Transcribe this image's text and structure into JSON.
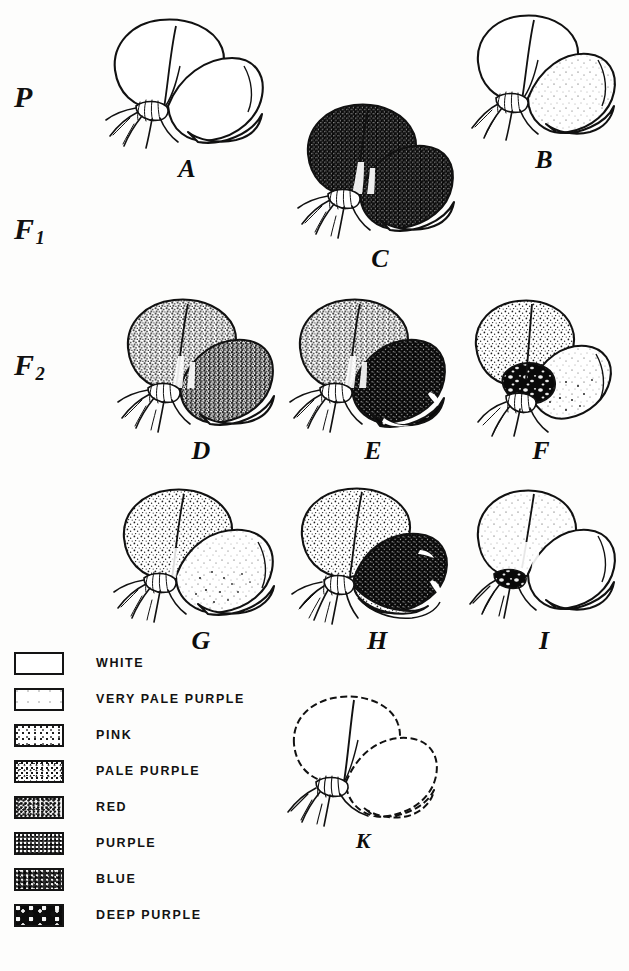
{
  "plate": {
    "title": "Inheritance of flower colour in the sweet pea",
    "background_color": "#fdfdfc",
    "ink_color": "#111111"
  },
  "generations": [
    {
      "id": "P",
      "label": "P",
      "subscript": "",
      "row_top": 80
    },
    {
      "id": "F1",
      "label": "F",
      "subscript": "1",
      "row_top": 212
    },
    {
      "id": "F2",
      "label": "F",
      "subscript": "2",
      "row_top": 348
    }
  ],
  "specimens": [
    {
      "caption": "A",
      "generation": "P",
      "left": 102,
      "top": 14,
      "width": 170,
      "height": 145,
      "caption_top": 152,
      "standard_color": "white",
      "wing_color": "white",
      "keel_color": "white",
      "outline": "solid"
    },
    {
      "caption": "B",
      "generation": "P",
      "left": 468,
      "top": 10,
      "width": 150,
      "height": 140,
      "caption_top": 145,
      "standard_color": "white",
      "wing_color": "very pale purple",
      "keel_color": "white",
      "outline": "solid"
    },
    {
      "caption": "C",
      "generation": "F1",
      "left": 296,
      "top": 100,
      "width": 165,
      "height": 148,
      "caption_top": 250,
      "standard_color": "purple",
      "wing_color": "purple",
      "keel_color": "white",
      "outline": "solid"
    },
    {
      "caption": "D",
      "generation": "F2",
      "left": 116,
      "top": 296,
      "width": 168,
      "height": 142,
      "caption_top": 437,
      "standard_color": "purple",
      "wing_color": "purple",
      "keel_color": "white",
      "outline": "solid"
    },
    {
      "caption": "E",
      "generation": "F2",
      "left": 288,
      "top": 296,
      "width": 168,
      "height": 142,
      "caption_top": 437,
      "standard_color": "purple",
      "wing_color": "deep purple",
      "keel_color": "deep purple",
      "outline": "solid"
    },
    {
      "caption": "F",
      "generation": "F2",
      "left": 462,
      "top": 296,
      "width": 156,
      "height": 142,
      "caption_top": 437,
      "standard_color": "pale purple",
      "wing_color": "very pale purple",
      "keel_color": "deep purple",
      "outline": "solid"
    },
    {
      "caption": "G",
      "generation": "F2",
      "left": 112,
      "top": 486,
      "width": 175,
      "height": 142,
      "caption_top": 632,
      "standard_color": "pink",
      "wing_color": "very pale purple",
      "keel_color": "white",
      "outline": "solid"
    },
    {
      "caption": "H",
      "generation": "F2",
      "left": 292,
      "top": 486,
      "width": 168,
      "height": 142,
      "caption_top": 632,
      "standard_color": "pink",
      "wing_color": "deep purple",
      "keel_color": "deep purple",
      "outline": "solid"
    },
    {
      "caption": "I",
      "generation": "F2",
      "left": 468,
      "top": 486,
      "width": 150,
      "height": 142,
      "caption_top": 632,
      "standard_color": "very pale purple",
      "wing_color": "white",
      "keel_color": "deep purple",
      "outline": "solid"
    },
    {
      "caption": "K",
      "generation": "F2",
      "left": 282,
      "top": 694,
      "width": 160,
      "height": 140,
      "caption_top": 830,
      "standard_color": "white",
      "wing_color": "white",
      "keel_color": "white",
      "outline": "dashed"
    }
  ],
  "legend": {
    "items": [
      {
        "label": "WHITE",
        "texture": "tex-white",
        "swatch_name": "swatch-white"
      },
      {
        "label": "VERY PALE PURPLE",
        "texture": "tex-verypale",
        "swatch_name": "swatch-very-pale-purple"
      },
      {
        "label": "PINK",
        "texture": "tex-pink",
        "swatch_name": "swatch-pink"
      },
      {
        "label": "PALE PURPLE",
        "texture": "tex-palepurple",
        "swatch_name": "swatch-pale-purple"
      },
      {
        "label": "RED",
        "texture": "tex-red",
        "swatch_name": "swatch-red"
      },
      {
        "label": "PURPLE",
        "texture": "tex-purple",
        "swatch_name": "swatch-purple"
      },
      {
        "label": "BLUE",
        "texture": "tex-blue",
        "swatch_name": "swatch-blue"
      },
      {
        "label": "DEEP PURPLE",
        "texture": "tex-deeppurple",
        "swatch_name": "swatch-deep-purple"
      }
    ]
  }
}
